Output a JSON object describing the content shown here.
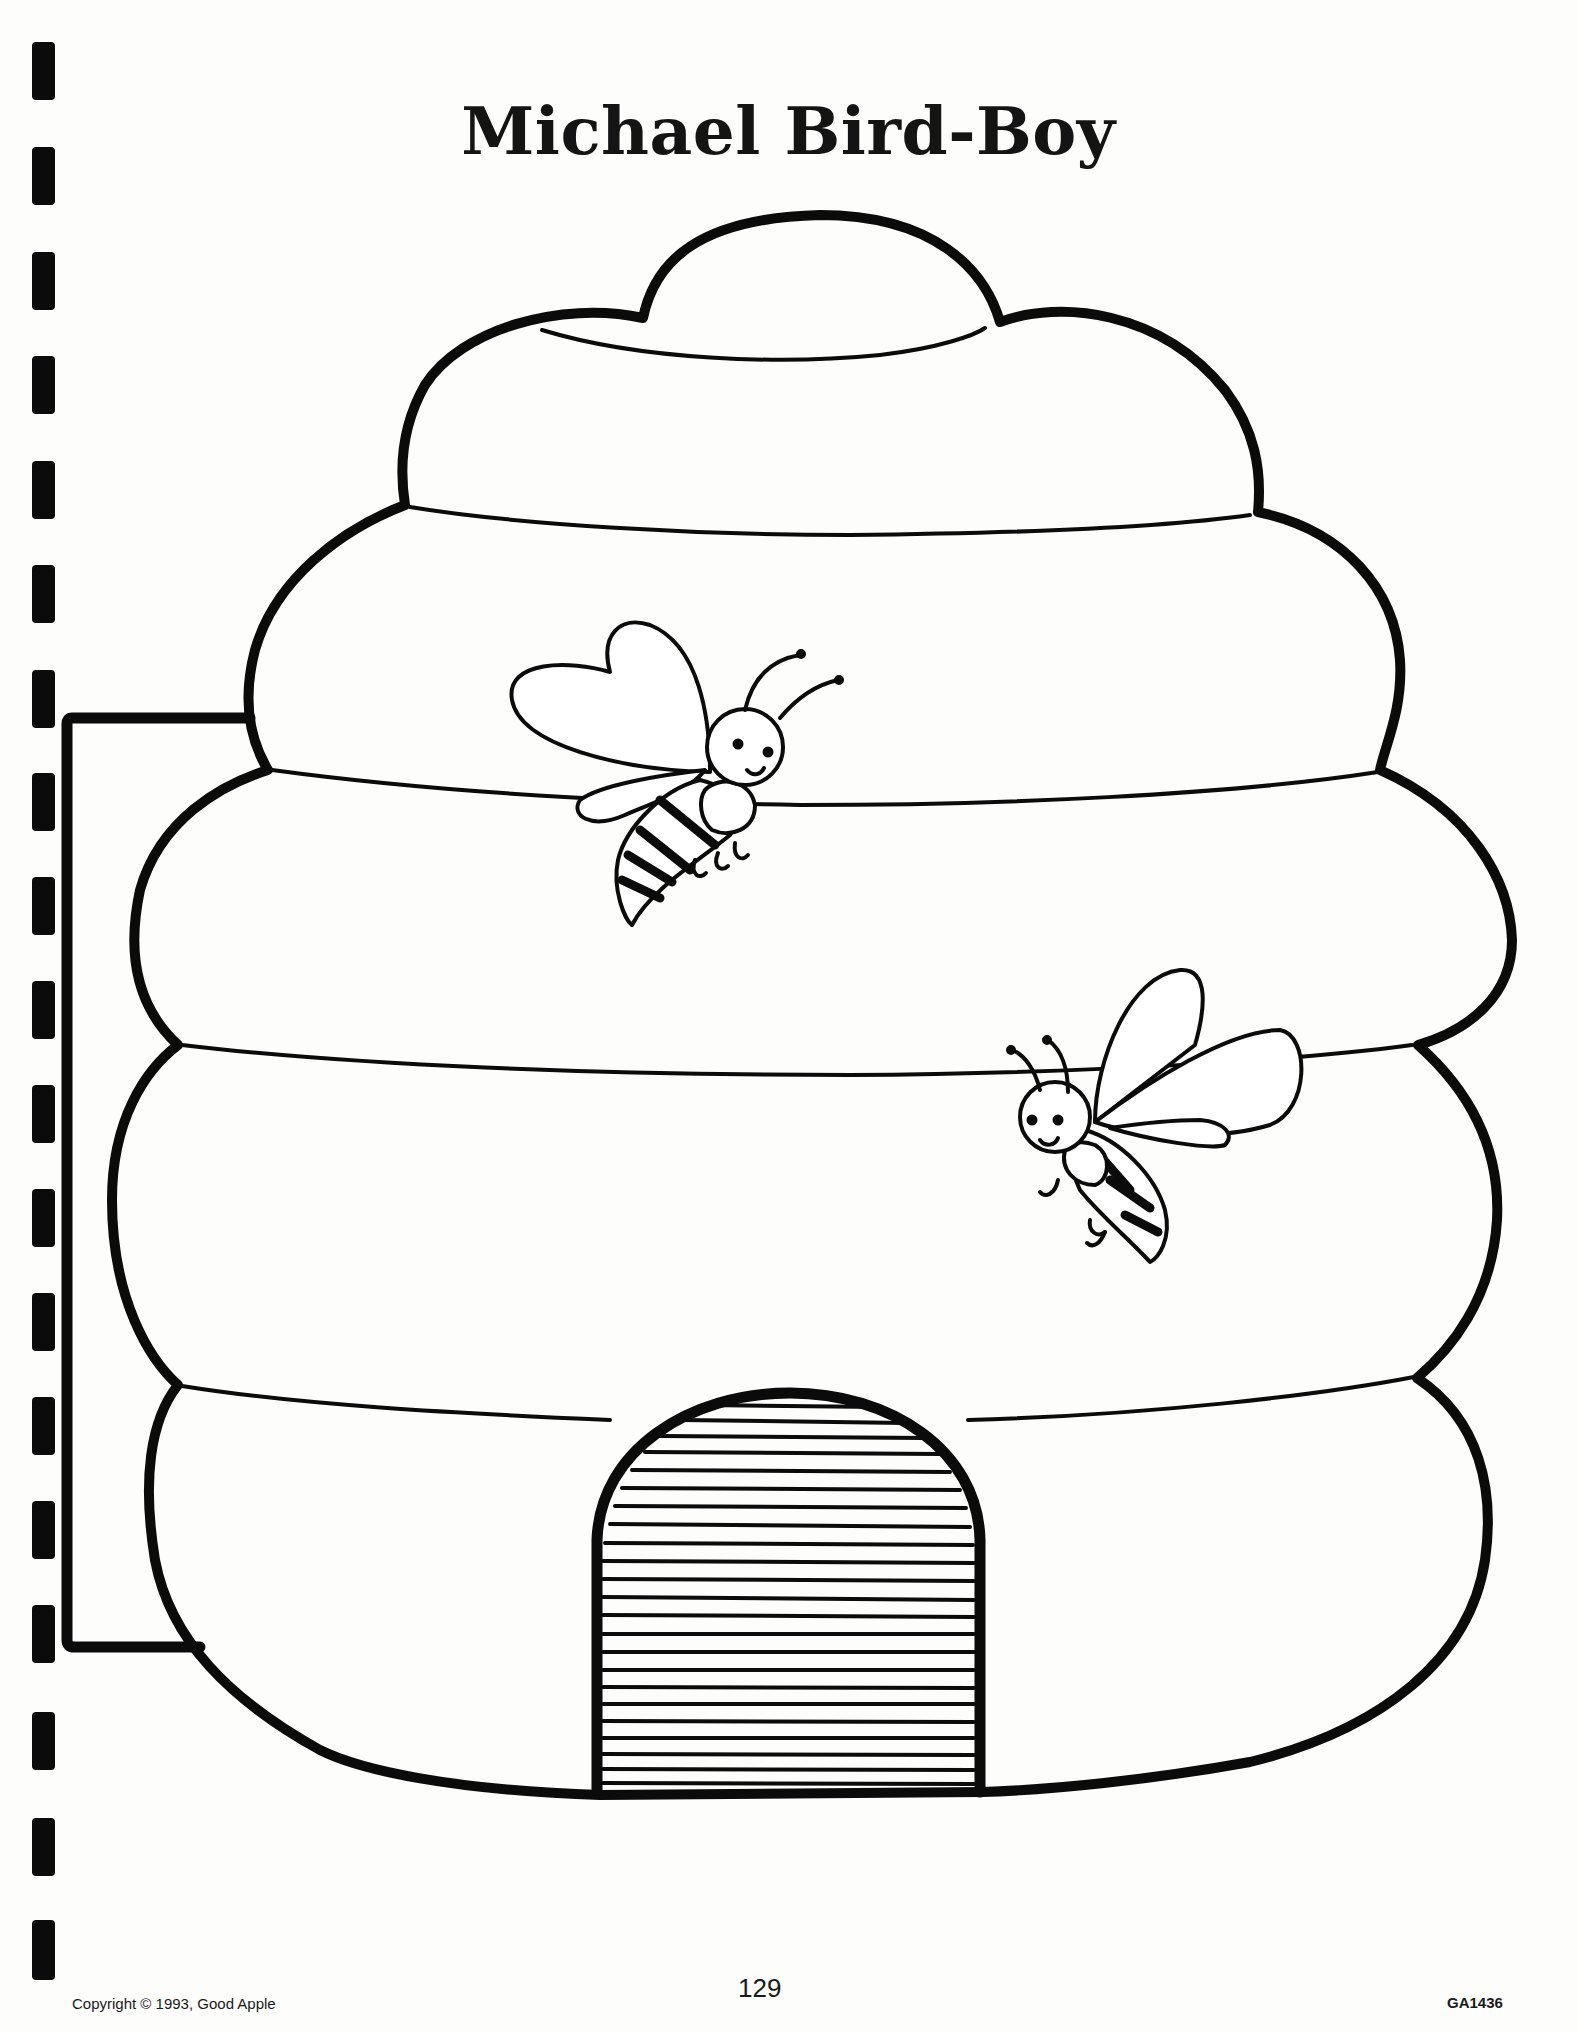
{
  "page": {
    "title": "Michael Bird-Boy",
    "illustration": "beehive-with-two-bees",
    "footer": {
      "copyright": "Copyright © 1993, Good Apple",
      "page_number": "129",
      "catalog_code": "GA1436"
    }
  },
  "colors": {
    "ink": "#0b0b0b",
    "paper": "#fdfdfc"
  },
  "binding": {
    "mark_count": 18
  }
}
